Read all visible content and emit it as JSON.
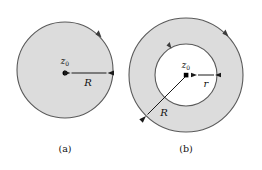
{
  "figure": {
    "panels": [
      {
        "id": "a",
        "caption": "(a)",
        "center_label_base": "z",
        "center_label_sub": "0",
        "radius_label": "R",
        "shape": "disk",
        "fill_color": "#dcdcdc",
        "boundary_color": "#5a5a5a",
        "orientation": "counterclockwise"
      },
      {
        "id": "b",
        "caption": "(b)",
        "center_label_base": "z",
        "center_label_sub": "0",
        "outer_radius_label": "R",
        "inner_radius_label": "r",
        "shape": "annulus",
        "fill_color": "#dcdcdc",
        "hole_color": "#ffffff",
        "boundary_color": "#5a5a5a",
        "orientation": "counterclockwise"
      }
    ]
  }
}
